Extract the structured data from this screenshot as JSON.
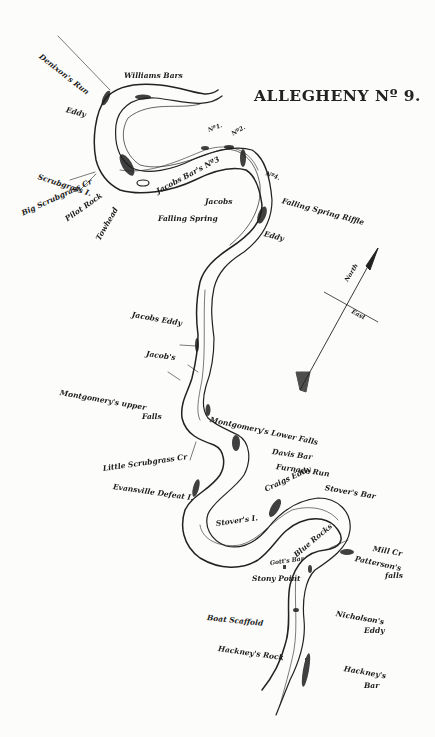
{
  "title": "ALLEGHENY Nº 9.",
  "compass": {
    "north_label": "North",
    "east_label": "East",
    "icon": "compass-arrow-icon"
  },
  "labels": {
    "denixons_run": "Denixon's Run",
    "williams_bars": "Williams Bars",
    "eddy_top": "Eddy",
    "scrubgrass_i": "Scrubgrass I.",
    "big_scrubgrass": "Big Scrubgrass Cr",
    "pilot_rock": "Pilot Rock",
    "towhead": "Towhead",
    "no1": "Nº1.",
    "no2": "Nº2.",
    "no3": "Jacobs Bar's Nº3",
    "no4": "Nº4.",
    "jacobs_top": "Jacobs",
    "falling_spring": "Falling Spring",
    "falling_spring_riffle": "Falling Spring Riffle",
    "eddy_mid": "Eddy",
    "jacobs_eddy": "Jacobs Eddy",
    "jacobs": "Jacob's",
    "montgomery_upper": "Montgomery's upper",
    "montgomery_upper_falls": "Falls",
    "montgomery_lower": "Montgomery's Lower Falls",
    "davis_bar": "Davis Bar",
    "furnace_run": "Furnace Run",
    "little_scrubgrass": "Little Scrubgrass Cr",
    "evansville_defeat": "Evansville Defeat I.",
    "craigs_eddy": "Craigs Eddy",
    "stovers_bar": "Stover's Bar",
    "stovers_i": "Stover's I.",
    "blue_rocks": "Blue Rocks",
    "gotts_bar": "Gott's Bar",
    "stony_point": "Stony Point",
    "mill_cr": "Mill Cr",
    "pattersons_falls": "Patterson's",
    "pattersons_falls2": "falls",
    "boat_scaffold": "Boat Scaffold",
    "nicholsons_eddy": "Nicholson's",
    "nicholsons_eddy2": "Eddy",
    "hackneys_rock": "Hackney's Rock",
    "hackneys_bar": "Hackney's",
    "hackneys_bar2": "Bar"
  }
}
